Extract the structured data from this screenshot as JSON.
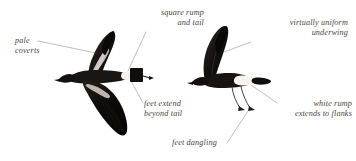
{
  "plate": {
    "background_color": "#ffffff",
    "ink_color": "#4a4540",
    "leader_color": "#8d8880",
    "subject": "storm-petrel-flight-comparison"
  },
  "labels": [
    {
      "id": "pale-coverts",
      "text": "pale\ncoverts",
      "align": "left",
      "points_to": "left-bird-upperwing-coverts"
    },
    {
      "id": "square-rump-and-tail",
      "text": "square rump\nand tail",
      "align": "right",
      "points_to": "left-bird-tail"
    },
    {
      "id": "virtually-uniform-underwing",
      "text": "virtually uniform\nunderwing",
      "align": "right",
      "points_to": "right-bird-underwing"
    },
    {
      "id": "feet-extend-beyond-tail",
      "text": "feet extend\nbeyond tail",
      "align": "left",
      "points_to": "left-bird-feet"
    },
    {
      "id": "white-rump-extends-to-flanks",
      "text": "white rump\nextends to flanks",
      "align": "right",
      "points_to": "right-bird-rump"
    },
    {
      "id": "feet-dangling",
      "text": "feet dangling",
      "align": "left",
      "points_to": "right-bird-legs"
    }
  ],
  "figures": [
    {
      "id": "left-bird",
      "name": "storm-petrel-upperside",
      "description": "dark storm-petrel in flight seen from above, wings raised and lowered, square black tail, pale upperwing covert bar, white rump",
      "plumage_colors": {
        "body": "#1a1715",
        "coverts_bar": "#cfc9c2",
        "rump": "#f2efe9"
      }
    },
    {
      "id": "right-bird",
      "name": "storm-petrel-underside",
      "description": "dark storm-petrel in flight seen from the side, near wing raised, uniform dark underwing, white rump band extending to flanks, legs and feet dangling below the tail",
      "plumage_colors": {
        "body": "#171412",
        "rump_band": "#f6f3ee",
        "legs": "#2b2724"
      }
    }
  ]
}
